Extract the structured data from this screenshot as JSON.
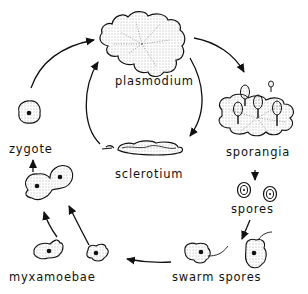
{
  "diagram": {
    "type": "life-cycle",
    "stages": [
      {
        "id": "plasmodium",
        "label": "plasmodium"
      },
      {
        "id": "sporangia",
        "label": "sporangia"
      },
      {
        "id": "spores",
        "label": "spores"
      },
      {
        "id": "swarm_spores",
        "label": "swarm spores"
      },
      {
        "id": "myxamoebae",
        "label": "myxamoebae"
      },
      {
        "id": "zygote",
        "label": "zygote"
      },
      {
        "id": "sclerotium",
        "label": "sclerotium"
      }
    ],
    "edges": [
      {
        "from": "plasmodium",
        "to": "sporangia"
      },
      {
        "from": "sporangia",
        "to": "spores"
      },
      {
        "from": "spores",
        "to": "swarm_spores"
      },
      {
        "from": "swarm_spores",
        "to": "myxamoebae"
      },
      {
        "from": "myxamoebae",
        "to": "zygote"
      },
      {
        "from": "zygote",
        "to": "plasmodium"
      },
      {
        "from": "plasmodium",
        "to": "sclerotium"
      },
      {
        "from": "sclerotium",
        "to": "plasmodium"
      }
    ],
    "colors": {
      "ink": "#111111",
      "background": "#ffffff",
      "stipple": "#555555"
    }
  }
}
